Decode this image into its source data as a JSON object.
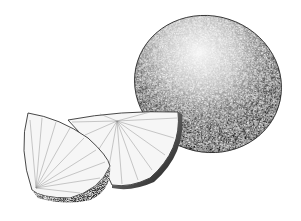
{
  "image": {
    "subject": "citrus fruit illustration",
    "description": "Stippled black-and-white ink drawing of a whole lime with two cut wedges",
    "colors": {
      "background": "#ffffff",
      "ink": "#111111",
      "highlight": "#f2f2f2"
    },
    "elements": [
      {
        "name": "whole-lime"
      },
      {
        "name": "lime-wedge-back"
      },
      {
        "name": "lime-wedge-front"
      }
    ]
  }
}
